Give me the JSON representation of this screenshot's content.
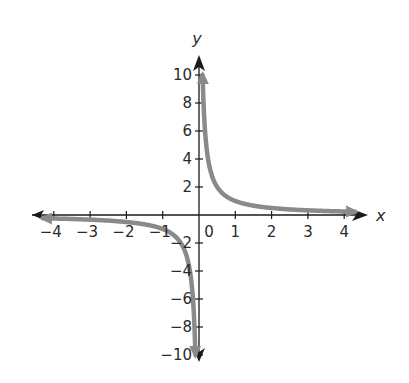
{
  "chart_data": {
    "type": "line",
    "title": "",
    "xlabel": "x",
    "ylabel": "y",
    "xlim": [
      -4.4,
      4.4
    ],
    "ylim": [
      -10.5,
      10.5
    ],
    "grid": false,
    "legend": null,
    "x_ticks": [
      -4,
      -3,
      -2,
      -1,
      1,
      2,
      3,
      4
    ],
    "x_tick_labels": [
      "−4",
      "−3",
      "−2",
      "−1",
      "1",
      "2",
      "3",
      "4"
    ],
    "y_ticks": [
      -10,
      -8,
      -6,
      -4,
      -2,
      2,
      4,
      6,
      8,
      10
    ],
    "y_tick_labels": [
      "−10",
      "−8",
      "−6",
      "−4",
      "−2",
      "2",
      "4",
      "6",
      "8",
      "10"
    ],
    "origin_label": "0",
    "series": [
      {
        "name": "y = 1/x (x > 0 branch)",
        "function": "1/x",
        "x": [
          0.1,
          0.125,
          0.2,
          0.25,
          0.5,
          1,
          2,
          3,
          4,
          4.3
        ],
        "y": [
          10,
          8,
          5,
          4,
          2,
          1,
          0.5,
          0.333,
          0.25,
          0.233
        ],
        "color": "#8a8a8a"
      },
      {
        "name": "y = 1/x (x < 0 branch)",
        "function": "1/x",
        "x": [
          -4.3,
          -4,
          -3,
          -2,
          -1,
          -0.5,
          -0.25,
          -0.2,
          -0.125,
          -0.1
        ],
        "y": [
          -0.233,
          -0.25,
          -0.333,
          -0.5,
          -1,
          -2,
          -4,
          -5,
          -8,
          -10
        ],
        "color": "#8a8a8a"
      }
    ],
    "annotations": [
      "Vertical asymptote x = 0",
      "Horizontal asymptote y = 0"
    ]
  },
  "colors": {
    "axis": "#1a1a1a",
    "curve": "#8a8a8a",
    "text": "#2a2a2a",
    "background": "#ffffff"
  }
}
